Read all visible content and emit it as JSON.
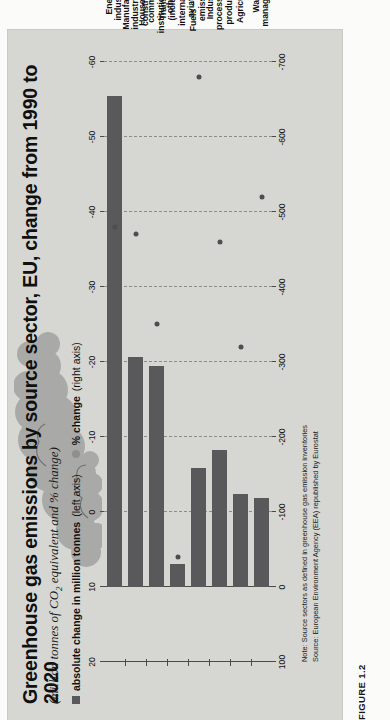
{
  "figure": {
    "caption": "FIGURE 1.2",
    "title": "Greenhouse gas emissions by source sector, EU, change from 1990 to 2020",
    "subtitle_pre": "(million tonnes of CO",
    "subtitle_sub": "2",
    "subtitle_post": " equivalent and % change)",
    "note": "Note: Source sectors as defined in greenhouse gas emission inventories",
    "source": "Source: European Environment Agency (EEA) republished by Eurostat"
  },
  "legend": {
    "items": [
      {
        "icon": "square-marker",
        "bold": "absolute change in million tonnes",
        "plain": " (left axis)",
        "color": "#59595b"
      },
      {
        "icon": "circle-marker",
        "bold": "% change",
        "plain": " (right axis)",
        "color": "#8e8f90"
      }
    ]
  },
  "colors": {
    "panel_background": "#d6d7d3",
    "bar": "#59595b",
    "dot": "#4d4e4f",
    "smoke": "#a9aaa7",
    "gridline": "#8c8d8a",
    "axis": "#4a4a4a"
  },
  "chart_data": {
    "type": "bar",
    "title": "Greenhouse gas emissions by source sector, EU, change from 1990 to 2020",
    "subtitle": "(million tonnes of CO2 equivalent and % change)",
    "xlabel": "",
    "ylabel": "absolute change in million tonnes",
    "y2label": "% change",
    "grid": true,
    "legend_position": "top-left",
    "categories": [
      "Energy industries",
      "Manufacturing industries and construction",
      "Households, commerce, institutions, and others",
      "Transport (including international aviation)",
      "Fuels – fugitive emissions",
      "Industrial processes and product use",
      "Agriculture",
      "Waste management"
    ],
    "series": [
      {
        "name": "absolute change in million tonnes (left axis)",
        "axis": "left",
        "type": "bar",
        "values": [
          -655,
          -307,
          -295,
          -30,
          -158,
          -182,
          -124,
          -118
        ]
      },
      {
        "name": "% change (right axis)",
        "axis": "right",
        "type": "scatter",
        "values": [
          -38,
          -37,
          -25,
          6,
          -58,
          -36,
          -22,
          -42
        ]
      }
    ],
    "ylim": [
      -700,
      100
    ],
    "yticks": [
      100,
      0,
      -100,
      -200,
      -300,
      -400,
      -500,
      -600,
      -700
    ],
    "ytick_labels": [
      "100",
      "0",
      "-100",
      "-200",
      "-300",
      "-400",
      "-500",
      "-600",
      "-700"
    ],
    "y2lim": [
      -60,
      20
    ],
    "y2ticks": [
      20,
      10,
      0,
      -10,
      -20,
      -30,
      -40,
      -50,
      -60
    ],
    "y2tick_labels": [
      "20",
      "10",
      "0",
      "-10",
      "-20",
      "-30",
      "-40",
      "-50",
      "-60"
    ]
  }
}
